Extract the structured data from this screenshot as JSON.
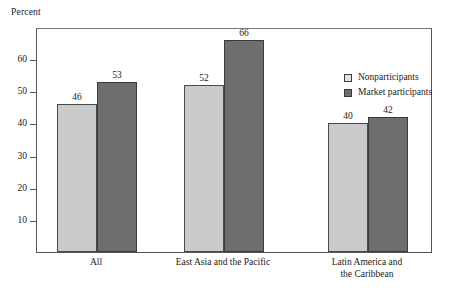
{
  "chart_data": {
    "type": "bar",
    "title": "",
    "subtitle": "",
    "xlabel": "",
    "ylabel": "Percent",
    "ylim": [
      0,
      70
    ],
    "ytick_labels": [
      "10",
      "20",
      "30",
      "40",
      "50",
      "60"
    ],
    "ytick_values": [
      10,
      20,
      30,
      40,
      50,
      60
    ],
    "grid": false,
    "legend_position": "inside-top-right",
    "categories": [
      "All",
      "East Asia and the Pacific",
      "Latin America and\nthe Caribbean"
    ],
    "series": [
      {
        "name": "Nonparticipants",
        "color": "#cbcbcb",
        "values": [
          46,
          52,
          40
        ]
      },
      {
        "name": "Market participants",
        "color": "#6e6e6e",
        "values": [
          53,
          66,
          42
        ]
      }
    ],
    "data_labels": [
      [
        "46",
        "53"
      ],
      [
        "52",
        "66"
      ],
      [
        "40",
        "42"
      ]
    ]
  },
  "legend": {
    "items": [
      {
        "label": "Nonparticipants",
        "swatch": "light-gray-square"
      },
      {
        "label": "Market participants",
        "swatch": "dark-gray-square"
      }
    ]
  },
  "axis": {
    "y_unit_label": "Percent"
  }
}
